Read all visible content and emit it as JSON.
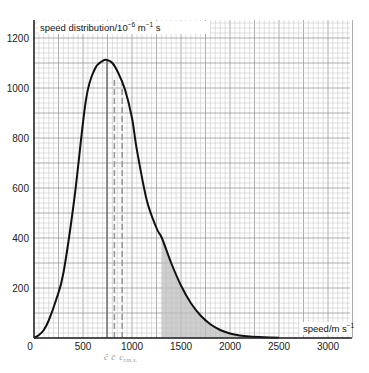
{
  "chart_data": {
    "type": "line",
    "title": "",
    "ylabel": "speed distribution/10⁻⁶ m⁻¹ s",
    "ylabel_parts": {
      "main": "speed distribution/10",
      "exp1": "−6",
      "unit1": " m",
      "exp2": "−1",
      "unit2": " s"
    },
    "xlabel": "speed/m s⁻¹",
    "xlabel_parts": {
      "main": "speed/m s",
      "exp": "−1"
    },
    "xlim": [
      0,
      3250
    ],
    "ylim": [
      0,
      1250
    ],
    "x_ticks": [
      0,
      500,
      1000,
      1500,
      2000,
      2500,
      3000
    ],
    "x_tick_labels": [
      "0",
      "500",
      "1000",
      "1500",
      "2000",
      "2500",
      "3000"
    ],
    "y_ticks": [
      200,
      400,
      600,
      800,
      1000,
      1200
    ],
    "y_tick_labels": [
      "200",
      "400",
      "600",
      "800",
      "1000",
      "1200"
    ],
    "grid": true,
    "grid_minor_x": 50,
    "grid_minor_y": 20,
    "series": [
      {
        "name": "Maxwell–Boltzmann speed distribution",
        "x": [
          0,
          50,
          100,
          150,
          225,
          300,
          410,
          530,
          620,
          700,
          745,
          800,
          860,
          930,
          1000,
          1050,
          1150,
          1250,
          1305,
          1400,
          1500,
          1600,
          1700,
          1800,
          1900,
          2000,
          2100,
          2200,
          2350,
          2500
        ],
        "values": [
          0,
          12,
          32,
          70,
          152,
          260,
          552,
          952,
          1075,
          1108,
          1112,
          1100,
          1060,
          992,
          880,
          752,
          552,
          440,
          400,
          300,
          210,
          140,
          90,
          55,
          32,
          18,
          10,
          6,
          3,
          1
        ]
      }
    ],
    "shaded_region": {
      "from_x": 1305,
      "to_x": 2500,
      "color": "#bdbdbd"
    },
    "vertical_markers": [
      {
        "x": 745,
        "style": "solid",
        "label": "ĉ"
      },
      {
        "x": 820,
        "style": "dashed",
        "label": "c̄"
      },
      {
        "x": 900,
        "style": "dashed",
        "label": "c",
        "subscript": "r.m.s."
      }
    ],
    "legend": null
  },
  "colors": {
    "curve": "#111111",
    "axis": "#222222",
    "grid_minor": "#c9c9c9",
    "grid_major": "#9a9a9a",
    "shade": "#bdbdbd",
    "marker_solid": "#777777",
    "marker_dashed": "#9a9a9a",
    "marker_label": "#9a9a9a"
  }
}
